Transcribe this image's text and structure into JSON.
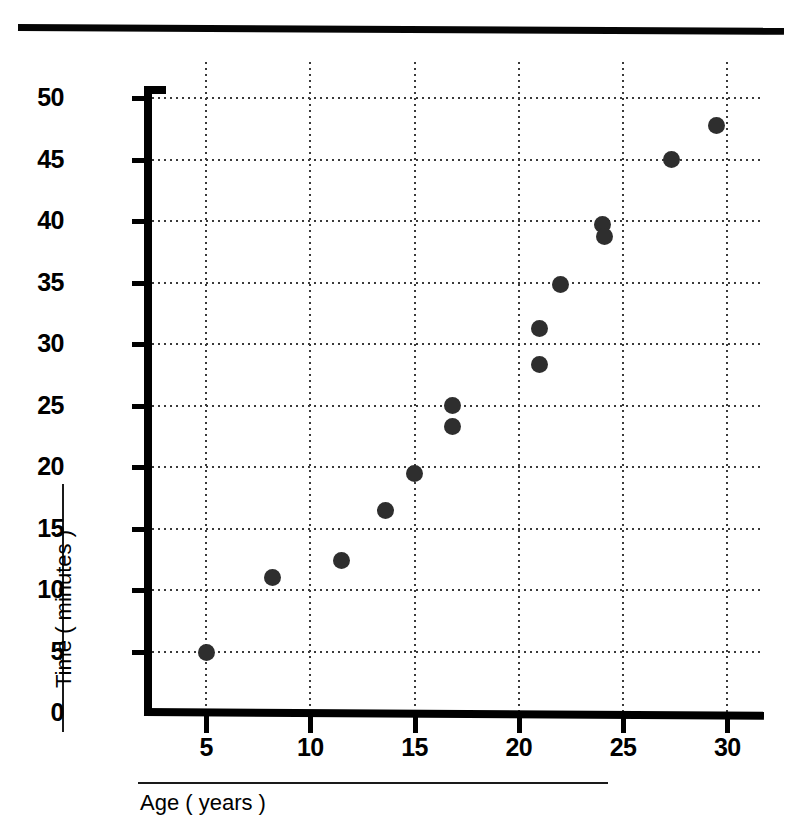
{
  "page": {
    "top_fragment": ""
  },
  "chart_data": {
    "type": "scatter",
    "title": "",
    "xlabel": "Age ( years )",
    "ylabel": "Time ( minutes )",
    "xlim": [
      2.5,
      32
    ],
    "ylim": [
      0,
      52
    ],
    "grid": true,
    "legend": null,
    "marker_color": "#2e2e2e",
    "axis_color": "#000000",
    "xticks": [
      5,
      10,
      15,
      20,
      25,
      30
    ],
    "xtick_labels": [
      "5",
      "10",
      "15",
      "20",
      "25",
      "30"
    ],
    "yticks": [
      0,
      5,
      10,
      15,
      20,
      25,
      30,
      35,
      40,
      45,
      50
    ],
    "ytick_labels": [
      "0",
      "5",
      "10",
      "15",
      "20",
      "25",
      "30",
      "35",
      "40",
      "45",
      "50"
    ],
    "x": [
      5.0,
      8.2,
      11.5,
      13.6,
      15.0,
      16.8,
      16.8,
      21.0,
      21.0,
      22.0,
      24.0,
      24.1,
      27.3,
      29.5
    ],
    "y": [
      4.9,
      11.0,
      12.4,
      16.5,
      19.5,
      25.0,
      23.3,
      31.3,
      28.3,
      34.8,
      39.7,
      38.7,
      45.0,
      47.8
    ],
    "points": [
      {
        "x": 5.0,
        "y": 4.9
      },
      {
        "x": 8.2,
        "y": 11.0
      },
      {
        "x": 11.5,
        "y": 12.4
      },
      {
        "x": 13.6,
        "y": 16.5
      },
      {
        "x": 15.0,
        "y": 19.5
      },
      {
        "x": 16.8,
        "y": 25.0
      },
      {
        "x": 16.8,
        "y": 23.3
      },
      {
        "x": 21.0,
        "y": 31.3
      },
      {
        "x": 21.0,
        "y": 28.3
      },
      {
        "x": 22.0,
        "y": 34.8
      },
      {
        "x": 24.0,
        "y": 39.7
      },
      {
        "x": 24.1,
        "y": 38.7
      },
      {
        "x": 27.3,
        "y": 45.0
      },
      {
        "x": 29.5,
        "y": 47.8
      }
    ]
  }
}
